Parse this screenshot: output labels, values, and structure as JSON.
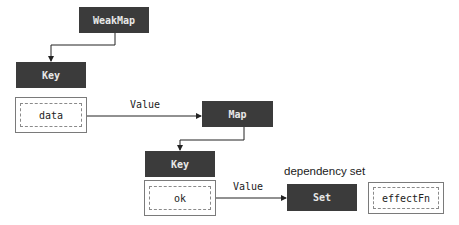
{
  "diagram": {
    "nodes": {
      "weakmap": {
        "label": "WeakMap"
      },
      "key1": {
        "label": "Key"
      },
      "data": {
        "label": "data"
      },
      "map": {
        "label": "Map"
      },
      "key2": {
        "label": "Key"
      },
      "ok": {
        "label": "ok"
      },
      "set": {
        "label": "Set"
      },
      "effectfn": {
        "label": "effectFn"
      }
    },
    "edges": {
      "data_to_map": {
        "label": "Value"
      },
      "ok_to_set": {
        "label": "Value"
      }
    },
    "captions": {
      "set_caption": "dependency set"
    },
    "colors": {
      "dark_box": "#3b3b3b",
      "dark_text": "#e8e8e8",
      "line": "#222222",
      "outline": "#7a7a7a"
    }
  }
}
